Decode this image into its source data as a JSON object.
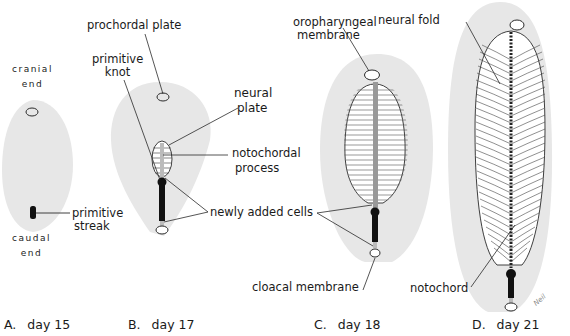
{
  "figure": {
    "panels": [
      {
        "id": "A",
        "letter": "A.",
        "caption": "day 15"
      },
      {
        "id": "B",
        "letter": "B.",
        "caption": "day 17"
      },
      {
        "id": "C",
        "letter": "C.",
        "caption": "day 18"
      },
      {
        "id": "D",
        "letter": "D.",
        "caption": "day 21"
      }
    ],
    "labels": {
      "cranial_end_1": "cranial",
      "cranial_end_2": "end",
      "caudal_end_1": "caudal",
      "caudal_end_2": "end",
      "primitive_streak_1": "primitive",
      "primitive_streak_2": "streak",
      "prochordal_plate": "prochordal plate",
      "primitive_knot_1": "primitive",
      "primitive_knot_2": "knot",
      "neural_plate_1": "neural",
      "neural_plate_2": "plate",
      "notochordal_process_1": "notochordal",
      "notochordal_process_2": "process",
      "newly_added_cells": "newly added cells",
      "oropharyngeal_membrane_1": "oropharyngeal",
      "oropharyngeal_membrane_2": "membrane",
      "cloacal_membrane": "cloacal membrane",
      "neural_fold": "neural fold",
      "notochord": "notochord"
    },
    "signature": "Neil",
    "colors": {
      "embryo_disc": "#e6e6e6",
      "outline": "#2a2a2a",
      "streak": "#111111",
      "background": "#ffffff"
    }
  }
}
